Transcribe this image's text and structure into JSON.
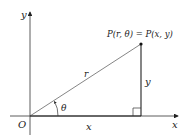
{
  "diagram": {
    "axes": {
      "x_label": "x",
      "y_label": "y",
      "origin_label": "O"
    },
    "point_label": "P(r, θ) = P(x, y)",
    "hypotenuse_label": "r",
    "angle_label": "θ",
    "adjacent_label": "x",
    "opposite_label": "y",
    "colors": {
      "line": "#555555",
      "axis": "#333333",
      "text": "#222222"
    }
  }
}
